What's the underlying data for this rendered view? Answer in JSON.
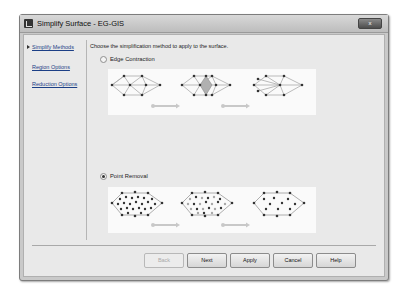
{
  "window": {
    "title": "Simplify Surface - EG-GIS",
    "close_label": "x"
  },
  "nav": {
    "items": [
      {
        "label": "Simplify Methods",
        "active": true
      },
      {
        "label": "Region Options",
        "active": false
      },
      {
        "label": "Reduction Options",
        "active": false
      }
    ]
  },
  "main": {
    "instruction": "Choose the simplification method to apply to the surface.",
    "options": [
      {
        "label": "Edge Contraction",
        "selected": false
      },
      {
        "label": "Point Removal",
        "selected": true
      }
    ]
  },
  "buttons": {
    "back": "Back",
    "next": "Next",
    "apply": "Apply",
    "cancel": "Cancel",
    "help": "Help"
  },
  "colors": {
    "window_frame": "#c9c9c9",
    "client_bg": "#e9e9e9",
    "link": "#1c3f86",
    "arrow": "#c8c8c8",
    "highlight": "#a9a9a9"
  }
}
